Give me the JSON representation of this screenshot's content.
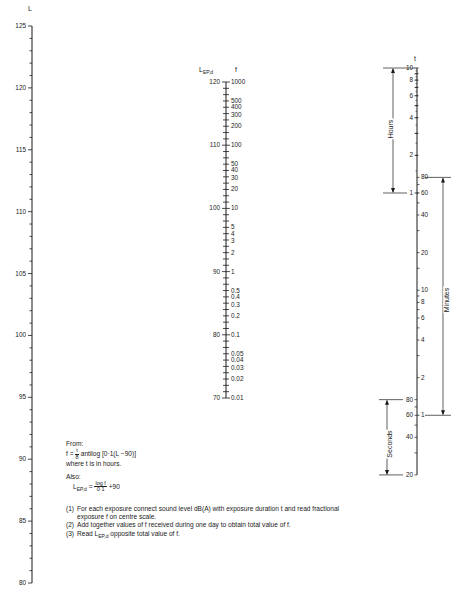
{
  "axes": {
    "left": {
      "label": "L",
      "ticks": [
        "125",
        "120",
        "115",
        "110",
        "105",
        "100",
        "95",
        "90",
        "85",
        "80"
      ]
    },
    "center": {
      "label_left": "L",
      "label_left_sub": "EP,d",
      "label_right": "f",
      "left_ticks": [
        "120",
        "110",
        "100",
        "90",
        "80",
        "70"
      ],
      "right_ticks": [
        "1000",
        "500",
        "400",
        "300",
        "200",
        "100",
        "50",
        "40",
        "30",
        "20",
        "10",
        "5",
        "4",
        "3",
        "2",
        "1",
        "0.5",
        "0.4",
        "0.3",
        "0.2",
        "0.1",
        "0.05",
        "0.04",
        "0.03",
        "0.02",
        "0.01"
      ]
    },
    "right": {
      "label": "t",
      "hours_label": "Hours",
      "minutes_label": "Minutes",
      "seconds_label": "Seconds",
      "hours_ticks": [
        "10",
        "8",
        "6",
        "4",
        "2",
        "1"
      ],
      "minutes_left_ticks": [
        "80",
        "60"
      ],
      "minutes_ticks": [
        "20",
        "10",
        "8",
        "6",
        "4",
        "2",
        "1"
      ],
      "seconds_left_ticks": [
        "80",
        "60",
        "40",
        "20"
      ],
      "minute_scale_left": [
        "40"
      ]
    }
  },
  "notes": {
    "from_label": "From:",
    "formula1_lhs": "f =",
    "formula1_num": "t",
    "formula1_den": "8",
    "formula1_rhs": "antilog [0·1(L −90)]",
    "where": "where t is in hours.",
    "also_label": "Also:",
    "formula2_lhs": "L",
    "formula2_lhs_sub": "EP,d",
    "formula2_eq": "=",
    "formula2_num": "log f",
    "formula2_den": "0·1",
    "formula2_rhs": "+90"
  },
  "steps": [
    {
      "n": "(1)",
      "text": "For each exposure connect sound level dB(A) with exposure duration t and read fractional exposure f on centre scale."
    },
    {
      "n": "(2)",
      "text": "Add together values of f received during one day to obtain total value of f."
    },
    {
      "n": "(3)",
      "text_pre": "Read L",
      "text_sub": "EP,d",
      "text_post": " opposite total value of f."
    }
  ],
  "chart_data": {
    "type": "nomogram",
    "title": "",
    "scales": [
      {
        "name": "L",
        "unit": "dB(A)",
        "range": [
          80,
          125
        ],
        "major_ticks": [
          80,
          85,
          90,
          95,
          100,
          105,
          110,
          115,
          120,
          125
        ],
        "minor_step": 1
      },
      {
        "name": "LEP,d",
        "range": [
          70,
          120
        ],
        "major_ticks": [
          70,
          80,
          90,
          100,
          110,
          120
        ]
      },
      {
        "name": "f",
        "range": [
          0.01,
          1000
        ],
        "scale": "log",
        "labels": [
          0.01,
          0.02,
          0.03,
          0.04,
          0.05,
          0.1,
          0.2,
          0.3,
          0.4,
          0.5,
          1,
          2,
          3,
          4,
          5,
          10,
          20,
          30,
          40,
          50,
          100,
          200,
          300,
          400,
          500,
          1000
        ]
      },
      {
        "name": "t (Hours)",
        "range": [
          1,
          10
        ],
        "scale": "log",
        "labels": [
          1,
          2,
          4,
          6,
          8,
          10
        ]
      },
      {
        "name": "t (Minutes)",
        "range": [
          1,
          80
        ],
        "scale": "log",
        "labels": [
          1,
          2,
          4,
          6,
          8,
          10,
          20,
          40,
          60,
          80
        ]
      },
      {
        "name": "t (Seconds)",
        "range": [
          20,
          80
        ],
        "scale": "log",
        "labels": [
          20,
          40,
          60,
          80
        ]
      }
    ],
    "relation": "f = (t/8) antilog[0.1(L-90)]; LEP,d = log f / 0.1 + 90"
  }
}
